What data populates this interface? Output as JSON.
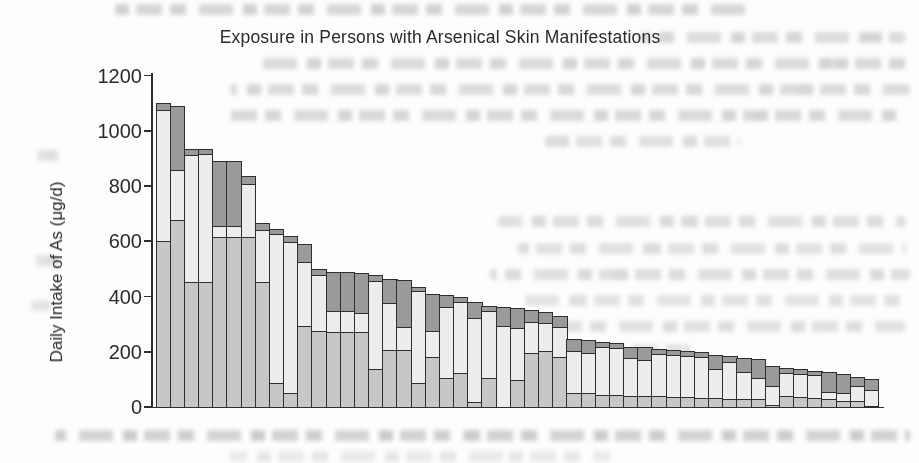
{
  "page": {
    "width": 919,
    "height": 463,
    "background": "#fdfdfc",
    "appearance": "scanned book page with chart"
  },
  "colors": {
    "axis": "#2e2e2e",
    "text": "#2a2a2a",
    "bar_border": "#2e2e2e",
    "segment_bottom": "#c7c7c7",
    "segment_middle": "#ededed",
    "segment_top": "#9a9a9a"
  },
  "chart_data": {
    "type": "bar",
    "stacked": true,
    "title": "Exposure in Persons with Arsenical Skin Manifestations",
    "xlabel": "",
    "ylabel": "Daily Intake of As (μg/d)",
    "ylim": [
      0,
      1200
    ],
    "yticks": [
      0,
      200,
      400,
      600,
      800,
      1000,
      1200
    ],
    "grid": false,
    "legend": "none",
    "n_bars": 51,
    "x_tick_labels": [],
    "series": [
      {
        "name": "segment-bottom",
        "color": "#c7c7c7",
        "values": [
          605,
          680,
          455,
          455,
          620,
          620,
          620,
          455,
          90,
          55,
          295,
          280,
          275,
          275,
          275,
          140,
          210,
          210,
          90,
          185,
          110,
          125,
          20,
          110,
          0,
          100,
          200,
          208,
          186,
          55,
          55,
          48,
          48,
          42,
          42,
          42,
          40,
          40,
          36,
          36,
          32,
          32,
          33,
          12,
          42,
          38,
          36,
          32,
          24,
          25,
          6
        ]
      },
      {
        "name": "segment-middle",
        "color": "#ededed",
        "values": [
          475,
          180,
          460,
          465,
          40,
          40,
          190,
          190,
          540,
          545,
          235,
          200,
          75,
          75,
          70,
          320,
          170,
          85,
          335,
          95,
          255,
          260,
          305,
          240,
          295,
          190,
          112,
          98,
          108,
          153,
          145,
          174,
          168,
          138,
          133,
          154,
          152,
          148,
          150,
          104,
          136,
          100,
          77,
          68,
          84,
          84,
          84,
          26,
          32,
          53,
          58
        ]
      },
      {
        "name": "segment-top",
        "color": "#9a9a9a",
        "values": [
          20,
          230,
          20,
          15,
          230,
          230,
          25,
          20,
          15,
          20,
          60,
          20,
          140,
          140,
          140,
          18,
          85,
          165,
          10,
          130,
          40,
          15,
          55,
          16,
          67,
          68,
          40,
          38,
          34,
          37,
          44,
          14,
          14,
          38,
          41,
          14,
          16,
          16,
          14,
          50,
          16,
          46,
          62,
          70,
          16,
          14,
          10,
          67,
          62,
          32,
          36
        ]
      }
    ],
    "totals": [
      1100,
      1090,
      935,
      935,
      890,
      890,
      835,
      665,
      645,
      620,
      590,
      500,
      490,
      490,
      485,
      478,
      465,
      460,
      435,
      410,
      405,
      400,
      380,
      366,
      362,
      358,
      352,
      344,
      328,
      245,
      244,
      236,
      230,
      218,
      216,
      210,
      208,
      204,
      200,
      190,
      184,
      178,
      172,
      150,
      142,
      136,
      130,
      125,
      118,
      110,
      100
    ]
  }
}
